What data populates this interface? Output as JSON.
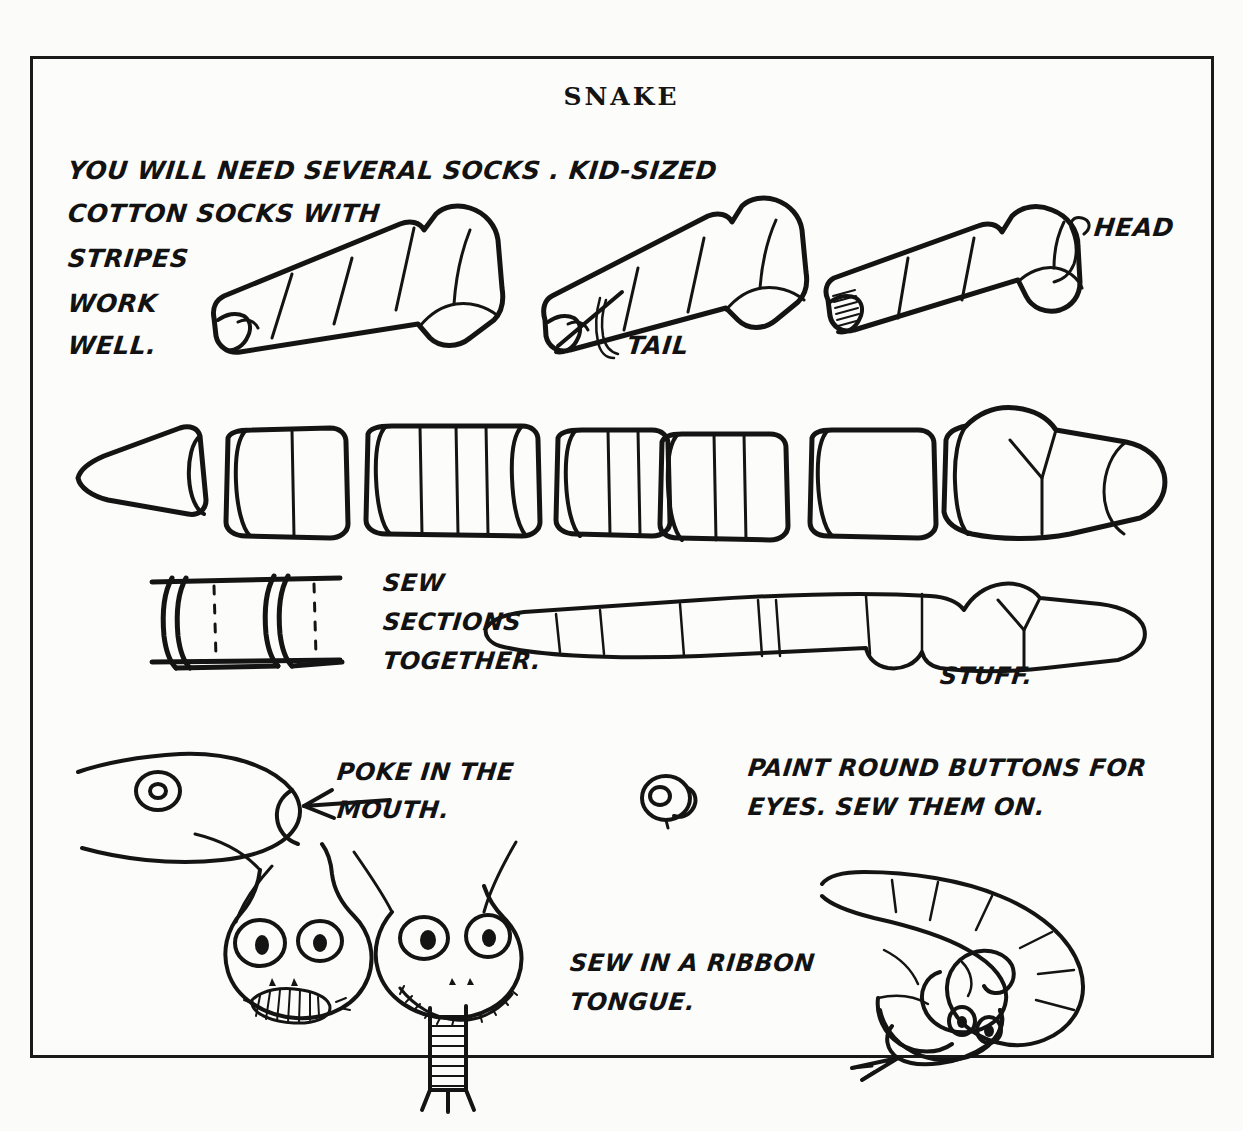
{
  "page": {
    "title": "SNAKE",
    "background_color": "#fbfbf9",
    "ink_color": "#141414"
  },
  "annotations": {
    "materials": "YOU WILL NEED SEVERAL SOCKS . KID-SIZED\nCOTTON SOCKS WITH\nSTRIPES\nWORK\nWELL.",
    "materials_lines": [
      "YOU WILL NEED SEVERAL SOCKS . KID-SIZED",
      "COTTON SOCKS WITH",
      "STRIPES",
      "WORK",
      "WELL."
    ],
    "head_label": "HEAD",
    "tail_label": "TAIL",
    "sew_sections": "SEW\nSECTIONS\nTOGETHER.",
    "sew_sections_lines": [
      "SEW",
      "SECTIONS",
      "TOGETHER."
    ],
    "stuff_label": "STUFF.",
    "poke_mouth": "POKE IN THE\nMOUTH.",
    "poke_mouth_lines": [
      "POKE IN THE",
      "MOUTH."
    ],
    "paint_buttons": "PAINT ROUND BUTTONS FOR\nEYES. SEW THEM ON.",
    "paint_buttons_lines": [
      "PAINT ROUND BUTTONS FOR",
      "EYES. SEW THEM ON."
    ],
    "ribbon_tongue": "SEW IN A RIBBON\nTONGUE.",
    "ribbon_tongue_lines": [
      "SEW IN A RIBBON",
      "TONGUE."
    ]
  },
  "figures": {
    "sock_plain": "striped-sock-figure",
    "sock_tail_cut": "striped-sock-tail-marked-figure",
    "sock_ribbed": "ribbed-cuff-sock-head-figure",
    "cut_sections_row": "cut-sock-tube-sections-row",
    "join_detail": "two-sections-stitched-detail",
    "assembled_body": "assembled-stuffed-snake-body",
    "head_profile": "snake-head-profile-with-mouth-arrow",
    "button_eye": "round-button-eye",
    "face_hatched_mouth": "snake-face-hatched-mouth",
    "face_ribbon_tongue": "snake-face-with-ribbon-tongue",
    "coiled_snake": "finished-coiled-snake"
  }
}
